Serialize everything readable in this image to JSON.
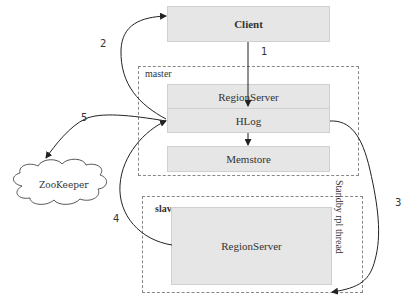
{
  "nodes": {
    "client": "Client",
    "master_regionserver": "RegionServer",
    "hlog": "HLog",
    "memstore": "Memstore",
    "slave_regionserver": "RegionServer",
    "zookeeper": "ZooKeeper"
  },
  "groups": {
    "master": "master",
    "slave": "slave"
  },
  "edges": {
    "e1": "1",
    "e2": "2",
    "e3": "3",
    "e4": "4",
    "e5": "5",
    "standby_thread": "Standby rpl thread"
  },
  "colors": {
    "box_fill": "#e6e6e6",
    "line": "#222222",
    "dash": "#888888"
  }
}
